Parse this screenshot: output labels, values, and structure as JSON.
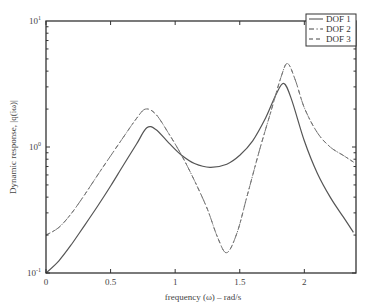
{
  "chart_data": {
    "type": "line",
    "title": "",
    "xlabel": "frequency (ω) – rad/s",
    "ylabel": "Dynamic response, |q(iω)|",
    "xlim": [
      0,
      2.4
    ],
    "ylim": [
      0.1,
      10
    ],
    "yscale": "log",
    "grid": false,
    "legend_position": "upper right",
    "x_ticks": [
      "0",
      "0.5",
      "1",
      "1.5",
      "2"
    ],
    "x_tick_values": [
      0,
      0.5,
      1,
      1.5,
      2
    ],
    "y_ticks": [
      {
        "base": "10",
        "exp": "1",
        "value": 10
      },
      {
        "base": "10",
        "exp": "0",
        "value": 1
      },
      {
        "base": "10",
        "exp": "-1",
        "value": 0.1
      }
    ],
    "legend": [
      {
        "label": "DOF 1",
        "style": "solid"
      },
      {
        "label": "DOF 2",
        "style": "dashdot"
      },
      {
        "label": "DOF 3",
        "style": "dashed"
      }
    ],
    "series": [
      {
        "name": "DOF 1",
        "style": "solid",
        "x": [
          0,
          0.1,
          0.2,
          0.3,
          0.4,
          0.5,
          0.6,
          0.7,
          0.78,
          0.85,
          0.95,
          1.05,
          1.15,
          1.27,
          1.4,
          1.5,
          1.6,
          1.7,
          1.78,
          1.84,
          1.9,
          2.0,
          2.1,
          2.2,
          2.3,
          2.38
        ],
        "y": [
          0.1,
          0.125,
          0.17,
          0.24,
          0.34,
          0.49,
          0.72,
          1.05,
          1.42,
          1.38,
          1.08,
          0.86,
          0.74,
          0.69,
          0.73,
          0.86,
          1.12,
          1.7,
          2.6,
          3.2,
          2.4,
          1.12,
          0.62,
          0.4,
          0.28,
          0.21
        ]
      },
      {
        "name": "DOF 2",
        "style": "dashdot",
        "x": [
          0,
          0.1,
          0.2,
          0.3,
          0.4,
          0.5,
          0.6,
          0.7,
          0.77,
          0.85,
          0.95,
          1.05,
          1.15,
          1.25,
          1.33,
          1.4,
          1.48,
          1.56,
          1.65,
          1.74,
          1.82,
          1.87,
          1.93,
          2.0,
          2.1,
          2.2,
          2.3,
          2.38
        ],
        "y": [
          0.2,
          0.23,
          0.3,
          0.42,
          0.6,
          0.85,
          1.2,
          1.68,
          2.0,
          1.82,
          1.28,
          0.86,
          0.54,
          0.32,
          0.19,
          0.145,
          0.21,
          0.42,
          0.92,
          1.9,
          3.6,
          4.6,
          3.4,
          2.05,
          1.3,
          1.0,
          0.86,
          0.76
        ]
      },
      {
        "name": "DOF 3",
        "style": "dashed",
        "x": [
          0,
          0.1,
          0.2,
          0.3,
          0.4,
          0.5,
          0.6,
          0.7,
          0.77,
          0.85,
          0.95,
          1.05,
          1.15,
          1.25,
          1.33,
          1.4,
          1.48,
          1.56,
          1.65,
          1.74,
          1.82,
          1.87,
          1.93,
          2.0,
          2.1,
          2.2,
          2.3,
          2.38
        ],
        "y": [
          0.2,
          0.23,
          0.3,
          0.42,
          0.6,
          0.85,
          1.2,
          1.68,
          2.0,
          1.82,
          1.28,
          0.86,
          0.54,
          0.32,
          0.19,
          0.145,
          0.21,
          0.42,
          0.92,
          1.9,
          3.6,
          4.6,
          3.4,
          2.05,
          1.3,
          1.0,
          0.86,
          0.76
        ]
      }
    ],
    "colors": {
      "axis": "#333333",
      "line": "#555555",
      "dash_line": "#777777",
      "background": "#ffffff"
    }
  }
}
